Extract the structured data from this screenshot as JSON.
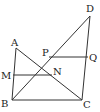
{
  "diagram": {
    "type": "geometry",
    "points": {
      "A": {
        "label": "A",
        "x": 16,
        "y": 48
      },
      "B": {
        "label": "B",
        "x": 12,
        "y": 100
      },
      "C": {
        "label": "C",
        "x": 82,
        "y": 100
      },
      "D": {
        "label": "D",
        "x": 90,
        "y": 16
      },
      "M": {
        "label": "M",
        "x": 13,
        "y": 75
      },
      "N": {
        "label": "N",
        "x": 52,
        "y": 75
      },
      "P": {
        "label": "P",
        "x": 49,
        "y": 57
      },
      "Q": {
        "label": "Q",
        "x": 88,
        "y": 57
      }
    },
    "segments": [
      "AB",
      "AC",
      "BC",
      "BD",
      "CD",
      "MN",
      "PQ"
    ],
    "colors": {
      "line": "#333333",
      "text": "#222222",
      "background": "#ffffff"
    }
  }
}
